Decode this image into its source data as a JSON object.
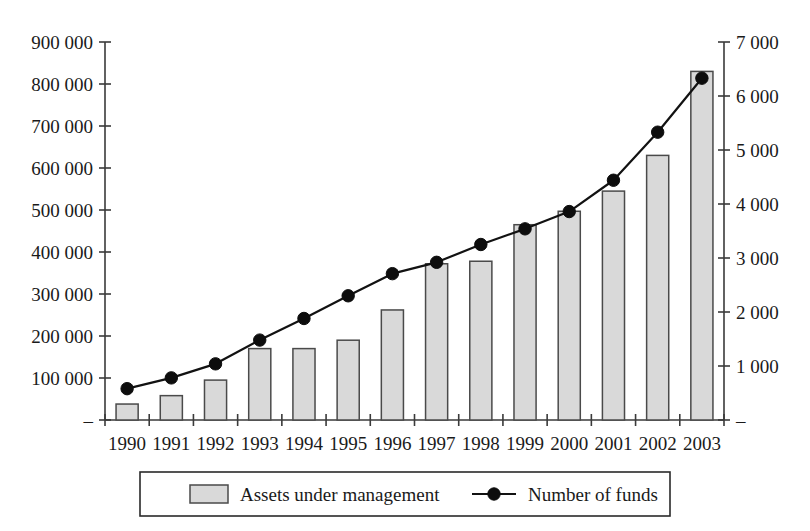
{
  "chart_data": {
    "type": "bar",
    "title": "",
    "subtitle": "",
    "xlabel": "",
    "ylabel": "",
    "categories": [
      "1990",
      "1991",
      "1992",
      "1993",
      "1994",
      "1995",
      "1996",
      "1997",
      "1998",
      "1999",
      "2000",
      "2001",
      "2002",
      "2003"
    ],
    "grid": false,
    "legend_position": "bottom",
    "axes": {
      "left": {
        "label": "",
        "ylim": [
          0,
          900000
        ],
        "tick_values": [
          0,
          100000,
          200000,
          300000,
          400000,
          500000,
          600000,
          700000,
          800000,
          900000
        ],
        "tick_labels": [
          "–",
          "100 000",
          "200 000",
          "300 000",
          "400 000",
          "500 000",
          "600 000",
          "700 000",
          "800 000",
          "900 000"
        ],
        "series_name": "Assets under management"
      },
      "right": {
        "label": "",
        "ylim": [
          0,
          7000
        ],
        "tick_values": [
          0,
          1000,
          2000,
          3000,
          4000,
          5000,
          6000,
          7000
        ],
        "tick_labels": [
          "–",
          "1 000",
          "2 000",
          "3 000",
          "4 000",
          "5 000",
          "6 000",
          "7 000"
        ],
        "series_name": "Number of funds"
      }
    },
    "series": [
      {
        "name": "Assets under management",
        "render": "bar",
        "axis": "left",
        "color_fill": "#d9d9d9",
        "color_stroke": "#4a4a4a",
        "values": [
          38000,
          58000,
          95000,
          170000,
          170000,
          190000,
          262000,
          372000,
          378000,
          465000,
          497000,
          545000,
          630000,
          830000
        ]
      },
      {
        "name": "Number of funds",
        "render": "line",
        "axis": "right",
        "marker": "circle",
        "color_stroke": "#121212",
        "color_marker": "#0d0d0d",
        "values": [
          580,
          780,
          1040,
          1480,
          1880,
          2300,
          2710,
          2920,
          3250,
          3540,
          3860,
          4440,
          5330,
          6330
        ]
      }
    ]
  },
  "legend": {
    "items": [
      {
        "label": "Assets under management",
        "marker": "bar-swatch"
      },
      {
        "label": "Number of funds",
        "marker": "line-with-dot"
      }
    ]
  }
}
